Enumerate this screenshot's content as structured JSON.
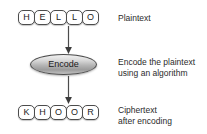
{
  "diagram": {
    "type": "flowchart",
    "background_color": "#ffffff",
    "text_color": "#2b2b2b",
    "outline_color": "#4c4c4c",
    "node_fill_color": "#b4b4b4"
  },
  "plaintext": {
    "word": "HELLO",
    "letters": [
      "H",
      "E",
      "L",
      "L",
      "O"
    ],
    "caption": "Plaintext"
  },
  "process": {
    "label": "Encode",
    "caption": "Encode the plaintext\nusing an algorithm"
  },
  "ciphertext": {
    "word": "KHOOR",
    "letters": [
      "K",
      "H",
      "O",
      "O",
      "R"
    ],
    "caption": "Ciphertext\nafter encoding"
  },
  "arrows": [
    {
      "name": "plaintext-to-encode",
      "direction": "down"
    },
    {
      "name": "encode-to-ciphertext",
      "direction": "down"
    }
  ]
}
